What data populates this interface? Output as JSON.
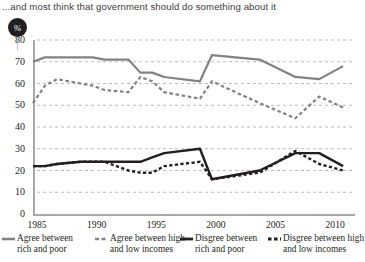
{
  "headline": "...and most think that government should do something about it",
  "badge": {
    "label": "%",
    "name": "percent-badge"
  },
  "axes": {
    "y_ticks": [
      "0",
      "10",
      "20",
      "30",
      "40",
      "50",
      "60",
      "70",
      "80"
    ],
    "x_ticks": [
      "1985",
      "1990",
      "1995",
      "2000",
      "2005",
      "2010"
    ]
  },
  "legend": [
    {
      "label_line1": "Agree between",
      "label_line2": "rich and poor",
      "style": "solid",
      "color": "#808285"
    },
    {
      "label_line1": "Agree between high",
      "label_line2": "and low incomes",
      "style": "dashed",
      "color": "#808285"
    },
    {
      "label_line1": "Disgree between",
      "label_line2": "rich and poor",
      "style": "solid",
      "color": "#231f20"
    },
    {
      "label_line1": "Disgree between high",
      "label_line2": "and low incomes",
      "style": "dashed",
      "color": "#231f20"
    }
  ],
  "chart_data": {
    "type": "line",
    "title": "...and most think that government should do something about it",
    "xlabel": "",
    "ylabel": "%",
    "xlim": [
      1985,
      2012
    ],
    "ylim": [
      0,
      80
    ],
    "ytick_step": 10,
    "grid": "horizontal-dashed",
    "legend_position": "bottom",
    "series": [
      {
        "name": "Agree between rich and poor",
        "color": "#808285",
        "style": "solid",
        "x": [
          1985,
          1986,
          1987,
          1989,
          1990,
          1991,
          1993,
          1994,
          1995,
          1996,
          1999,
          2000,
          2004,
          2007,
          2009,
          2011
        ],
        "values": [
          70,
          72,
          72,
          72,
          72,
          71,
          71,
          65,
          65,
          63,
          61,
          73,
          71,
          63,
          62,
          68
        ]
      },
      {
        "name": "Agree between high and low incomes",
        "color": "#808285",
        "style": "dashed",
        "x": [
          1985,
          1986,
          1987,
          1989,
          1990,
          1991,
          1993,
          1994,
          1995,
          1996,
          1999,
          2000,
          2004,
          2007,
          2009,
          2011
        ],
        "values": [
          51,
          59,
          62,
          60,
          59,
          57,
          56,
          63,
          61,
          56,
          53,
          61,
          51,
          44,
          54,
          49
        ]
      },
      {
        "name": "Disgree between rich and poor",
        "color": "#231f20",
        "style": "solid",
        "x": [
          1985,
          1986,
          1987,
          1989,
          1990,
          1991,
          1993,
          1994,
          1995,
          1996,
          1999,
          2000,
          2004,
          2007,
          2009,
          2011
        ],
        "values": [
          22,
          22,
          23,
          24,
          24,
          24,
          24,
          24,
          26,
          28,
          30,
          16,
          20,
          28,
          28,
          22
        ]
      },
      {
        "name": "Disgree between high and low incomes",
        "color": "#231f20",
        "style": "dashed",
        "x": [
          1985,
          1986,
          1987,
          1989,
          1990,
          1991,
          1993,
          1994,
          1995,
          1996,
          1999,
          2000,
          2004,
          2007,
          2009,
          2011
        ],
        "values": [
          22,
          22,
          23,
          24,
          24,
          24,
          20,
          19,
          19,
          22,
          24,
          16,
          19,
          29,
          23,
          20
        ]
      }
    ]
  }
}
